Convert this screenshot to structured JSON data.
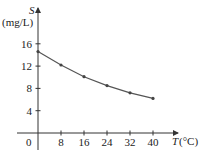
{
  "chart_data": {
    "type": "line",
    "title": "",
    "xlabel": "T (°C)",
    "xlabel_var": "T",
    "xlabel_unit": "(°C)",
    "ylabel": "S (mg/L)",
    "ylabel_var": "S",
    "ylabel_unit": "(mg/L)",
    "origin_label": "0",
    "x_ticks": [
      8,
      16,
      24,
      32,
      40
    ],
    "y_ticks": [
      4,
      8,
      12,
      16
    ],
    "xlim": [
      0,
      45
    ],
    "ylim": [
      0,
      20
    ],
    "grid": false,
    "legend": null,
    "markers": true,
    "x": [
      0,
      8,
      16,
      24,
      32,
      40
    ],
    "series": [
      {
        "name": "S",
        "values": [
          14.6,
          12.2,
          10.1,
          8.5,
          7.2,
          6.2
        ]
      }
    ],
    "colors": {
      "line": "#555555",
      "axis": "#333333",
      "text": "#222222"
    }
  }
}
